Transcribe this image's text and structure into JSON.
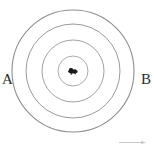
{
  "figure": {
    "background_color": "#ffffff",
    "stroke_color": "#9a9a9a",
    "label_color": "#2b2b2b"
  },
  "labels": {
    "left": "A",
    "right": "B"
  },
  "center_mark": {
    "name": "center-point-mark",
    "color": "#1a1a1a"
  },
  "chart_data": {
    "type": "scatter",
    "subtitle": "",
    "xlabel": "",
    "ylabel": "",
    "grid": false,
    "legend": "none",
    "annotations": [
      "A",
      "B"
    ],
    "center": {
      "x": 73,
      "y": 71
    },
    "circles": [
      {
        "name": "ring-1-outer",
        "radius": 61,
        "stroke": "#8e8e8e"
      },
      {
        "name": "ring-2",
        "radius": 47,
        "stroke": "#9b9b9b"
      },
      {
        "name": "ring-3",
        "radius": 31,
        "stroke": "#a2a2a2"
      },
      {
        "name": "ring-4-inner",
        "radius": 15,
        "stroke": "#ababab"
      }
    ],
    "points": [
      {
        "label": "A",
        "x": 7,
        "y": 78
      },
      {
        "label": "B",
        "x": 145,
        "y": 78
      },
      {
        "label": "center",
        "x": 73,
        "y": 71
      }
    ],
    "xlim": [
      0,
      154
    ],
    "ylim": [
      0,
      147
    ]
  }
}
